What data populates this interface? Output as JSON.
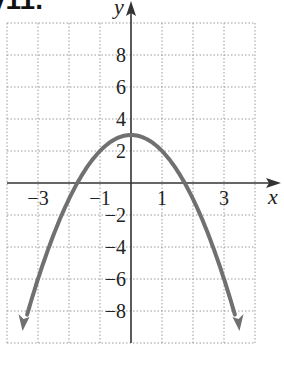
{
  "heading": "y11.",
  "chart_data": {
    "type": "line",
    "title": "",
    "xlabel": "x",
    "ylabel": "y",
    "xlim": [
      -4,
      4
    ],
    "ylim": [
      -10,
      10
    ],
    "grid": true,
    "x_tick_labels": [
      "-3",
      "-1",
      "1",
      "3"
    ],
    "x_ticks": [
      -3,
      -1,
      1,
      3
    ],
    "y_tick_labels": [
      "8",
      "6",
      "4",
      "2",
      "-2",
      "-4",
      "-6",
      "-8"
    ],
    "y_ticks": [
      8,
      6,
      4,
      2,
      -2,
      -4,
      -6,
      -8
    ],
    "series": [
      {
        "name": "y = 3 - x^2",
        "function": "y = -x^2 + 3",
        "x": [
          -3.5,
          -3,
          -2,
          -1.73,
          -1,
          0,
          1,
          1.73,
          2,
          3,
          3.5
        ],
        "y": [
          -9.25,
          -6,
          -1,
          0,
          2,
          3,
          2,
          0,
          -1,
          -6,
          -9.25
        ],
        "color": "#707070",
        "arrows_at_ends": true
      }
    ],
    "vertex": [
      0,
      3
    ],
    "x_intercepts": [
      -1.73,
      1.73
    ]
  },
  "colors": {
    "curve": "#707070",
    "axis": "#333333",
    "grid": "#9a9a9a"
  }
}
